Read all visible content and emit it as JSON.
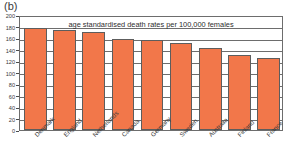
{
  "panel": {
    "label": "(b)"
  },
  "chart_data": {
    "type": "bar",
    "title": "age standardised death rates per 100,000 females",
    "xlabel": "",
    "ylabel": "",
    "ylim": [
      0,
      200
    ],
    "yticks": [
      0,
      20,
      40,
      60,
      80,
      100,
      120,
      140,
      160,
      180,
      200
    ],
    "grid": true,
    "legend": "none",
    "bar_color": "#F2774A",
    "bar_edge_color": "#5d5d5d",
    "categories": [
      "Denmark",
      "England",
      "Netherlands",
      "Canada",
      "Germany",
      "Sweden",
      "Australia",
      "Finland",
      "France"
    ],
    "values": [
      178,
      174,
      170,
      158,
      156,
      152,
      143,
      130,
      125
    ]
  }
}
